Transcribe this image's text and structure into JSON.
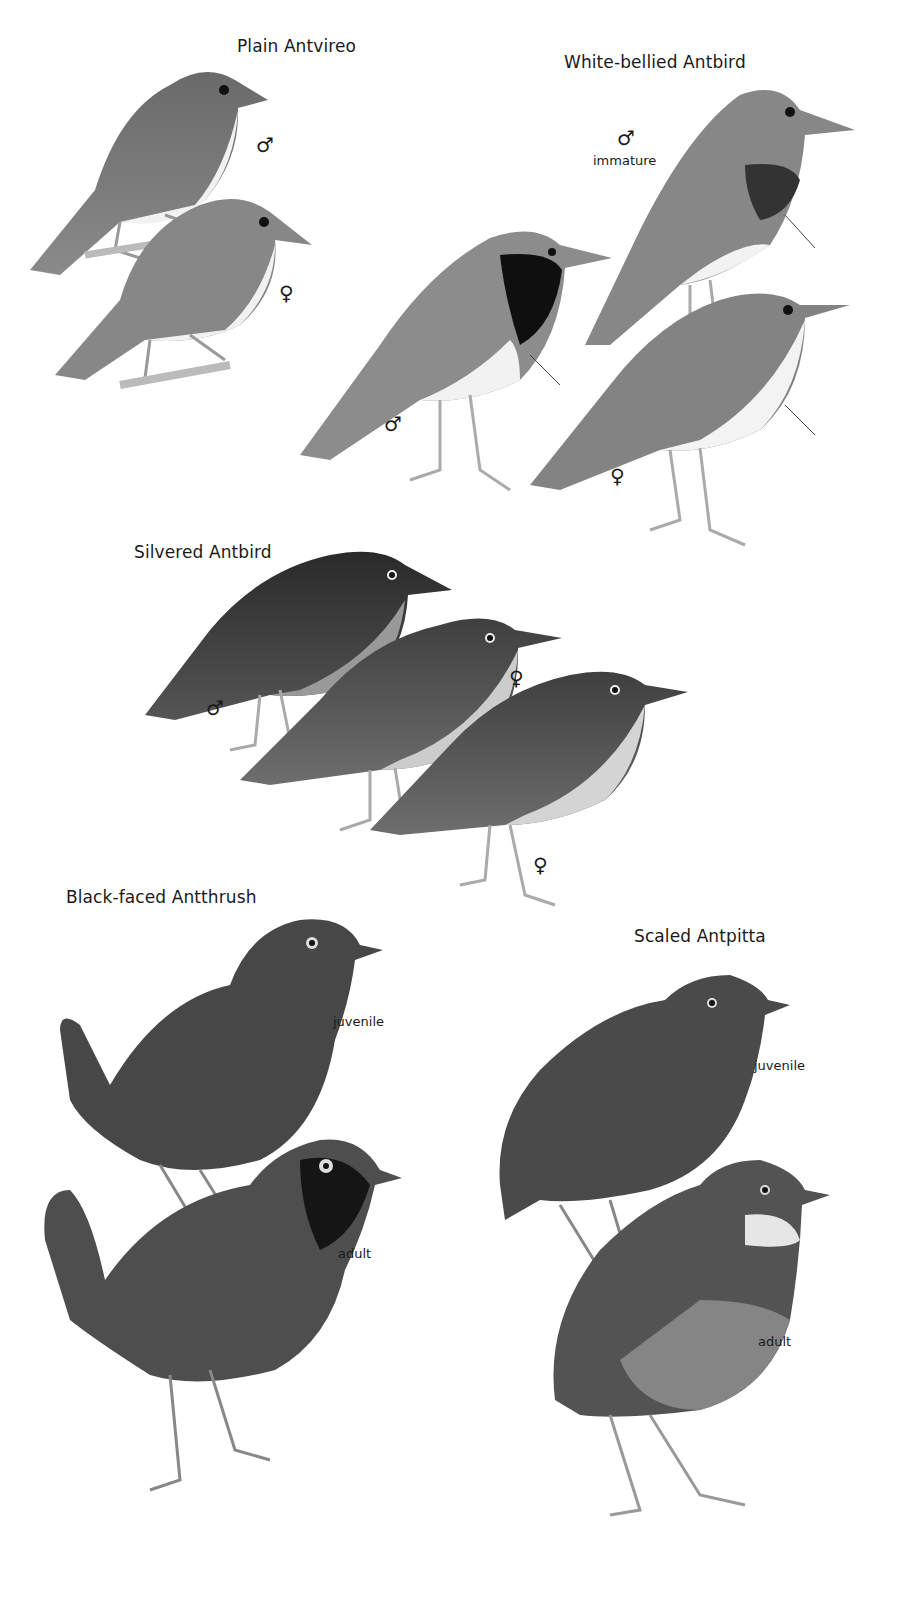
{
  "plate": {
    "species": [
      {
        "name": "Plain Antvireo",
        "labels": [
          {
            "text": "♂",
            "kind": "sex-male"
          },
          {
            "text": "♀",
            "kind": "sex-female"
          }
        ]
      },
      {
        "name": "White-bellied Antbird",
        "labels": [
          {
            "text": "♂",
            "kind": "sex-male"
          },
          {
            "text": "immature",
            "kind": "age"
          },
          {
            "text": "♂",
            "kind": "sex-male"
          },
          {
            "text": "♀",
            "kind": "sex-female"
          }
        ]
      },
      {
        "name": "Silvered Antbird",
        "labels": [
          {
            "text": "♂",
            "kind": "sex-male"
          },
          {
            "text": "♀",
            "kind": "sex-female"
          },
          {
            "text": "♀",
            "kind": "sex-female"
          }
        ]
      },
      {
        "name": "Black-faced Antthrush",
        "labels": [
          {
            "text": "juvenile",
            "kind": "age"
          },
          {
            "text": "adult",
            "kind": "age"
          }
        ]
      },
      {
        "name": "Scaled Antpitta",
        "labels": [
          {
            "text": "juvenile",
            "kind": "age"
          },
          {
            "text": "adult",
            "kind": "age"
          }
        ]
      }
    ]
  }
}
